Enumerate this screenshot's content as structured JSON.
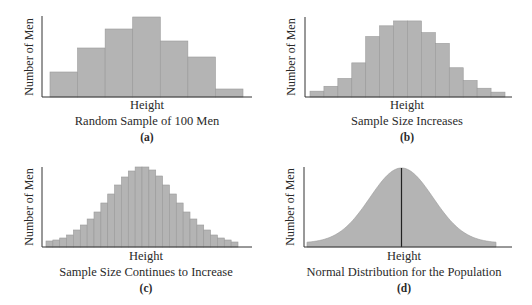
{
  "chart_data": [
    {
      "id": "a",
      "type": "bar",
      "title": "",
      "xlabel": "Height",
      "ylabel": "Number of Men",
      "caption": "Random Sample of 100 Men",
      "panel_label": "(a)",
      "values": [
        25,
        49,
        68,
        80,
        56,
        40,
        8
      ],
      "ylim": [
        0,
        80
      ],
      "grid": false
    },
    {
      "id": "b",
      "type": "bar",
      "title": "",
      "xlabel": "Height",
      "ylabel": "Number of Men",
      "caption": "Sample Size Increases",
      "panel_label": "(b)",
      "values": [
        6,
        11,
        19,
        35,
        62,
        73,
        78,
        78,
        66,
        55,
        30,
        17,
        9,
        5
      ],
      "ylim": [
        0,
        80
      ],
      "grid": false
    },
    {
      "id": "c",
      "type": "bar",
      "title": "",
      "xlabel": "Height",
      "ylabel": "Number of Men",
      "caption": "Sample Size Continues to Increase",
      "panel_label": "(c)",
      "values": [
        6,
        7,
        9,
        12,
        17,
        22,
        28,
        35,
        44,
        53,
        62,
        70,
        76,
        80,
        80,
        77,
        71,
        62,
        53,
        44,
        35,
        28,
        22,
        17,
        12,
        9,
        7,
        5
      ],
      "ylim": [
        0,
        80
      ],
      "grid": false
    },
    {
      "id": "d",
      "type": "area",
      "title": "",
      "xlabel": "Height",
      "ylabel": "Number of Men",
      "caption": "Normal Distribution for the Population",
      "panel_label": "(d)",
      "distribution": "normal",
      "mean_line": true,
      "x_range_sd": [
        -3,
        3
      ],
      "ylim": [
        0,
        80
      ],
      "grid": false
    }
  ]
}
